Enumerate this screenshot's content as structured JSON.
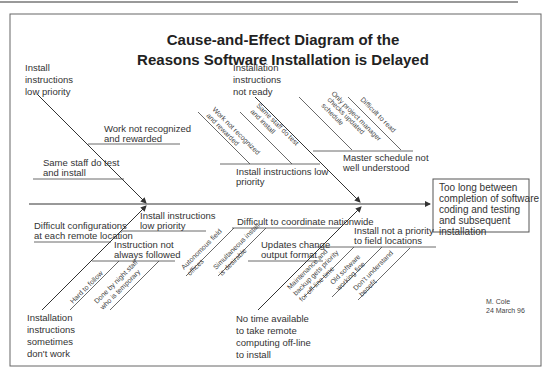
{
  "title": {
    "line1": "Cause-and-Effect Diagram of the",
    "line2": "Reasons Software Installation is Delayed"
  },
  "effect": {
    "lines": [
      "Too long between",
      "completion of software",
      "coding and testing",
      "and subsequent",
      "installation"
    ]
  },
  "categories": {
    "top_left": {
      "lines": [
        "Install",
        "instructions",
        "low priority"
      ],
      "causes": [
        {
          "lines": [
            "Work not recognized",
            "and rewarded"
          ]
        },
        {
          "lines": [
            "Same staff do test",
            "and install"
          ]
        }
      ]
    },
    "top_middle": {
      "lines": [
        "Installation",
        "instructions",
        "not ready"
      ],
      "causes": [
        {
          "lines": [
            "Install instructions low",
            "priority"
          ],
          "subcauses": [
            {
              "lines": [
                "Work not recognized",
                "and rewarded"
              ]
            },
            {
              "lines": [
                "Same staff do test",
                "and install"
              ]
            }
          ]
        },
        {
          "lines": [
            "Master schedule not",
            "well understood"
          ],
          "subcauses": [
            {
              "lines": [
                "Only project manager",
                "checks updated",
                "schedule"
              ]
            },
            {
              "lines": [
                "Difficult to read"
              ]
            }
          ]
        }
      ]
    },
    "bottom_left": {
      "lines": [
        "Installation",
        "instructions",
        "sometimes",
        "don't work"
      ],
      "causes": [
        {
          "lines": [
            "Difficult configurations",
            "at each remote  location"
          ]
        },
        {
          "lines": [
            "Install instructions",
            "low priority"
          ]
        },
        {
          "lines": [
            "Instruction not",
            "always followed"
          ],
          "subcauses": [
            {
              "lines": [
                "Hard to follow"
              ]
            },
            {
              "lines": [
                "Done by night staff",
                "who is temporary"
              ]
            }
          ]
        }
      ]
    },
    "bottom_middle": {
      "lines": [
        "No time available",
        "to take remote",
        "computing off-line",
        "to install"
      ],
      "causes": [
        {
          "lines": [
            "Difficult to coordinate nationwide"
          ],
          "subcauses": [
            {
              "lines": [
                "Autonomous field",
                "offices"
              ]
            },
            {
              "lines": [
                "Simultaneous install",
                "is desirable"
              ]
            }
          ]
        },
        {
          "lines": [
            "Updates change",
            "output format"
          ]
        },
        {
          "lines": [
            "Install not a priority",
            "to field locations"
          ],
          "subcauses": [
            {
              "lines": [
                "Maintenance and",
                "backup gets priority",
                "for off-line time"
              ]
            },
            {
              "lines": [
                "Old software",
                "working fine"
              ]
            },
            {
              "lines": [
                "Don't understand",
                "benefit"
              ]
            }
          ]
        }
      ]
    }
  },
  "author": {
    "name": "M. Cole",
    "date": "24 March 96"
  }
}
